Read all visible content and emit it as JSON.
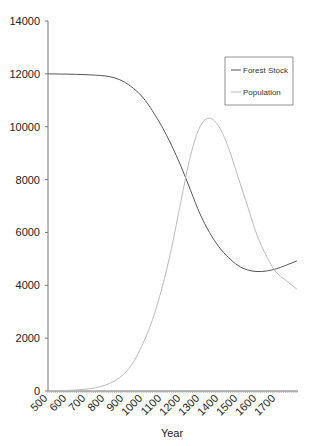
{
  "chart_data": {
    "type": "line",
    "title": "",
    "xlabel": "Year",
    "ylabel": "",
    "xlim": [
      500,
      1810
    ],
    "ylim": [
      0,
      14000
    ],
    "grid": false,
    "legend_position": "upper right",
    "x_tick_labels": [
      "500",
      "600",
      "700",
      "800",
      "900",
      "1000",
      "1100",
      "1200",
      "1300",
      "1400",
      "1500",
      "1600",
      "1700"
    ],
    "y_tick_labels": [
      "0",
      "2000",
      "4000",
      "6000",
      "8000",
      "10000",
      "12000",
      "14000"
    ],
    "x": [
      500,
      550,
      600,
      650,
      700,
      750,
      800,
      850,
      900,
      950,
      1000,
      1050,
      1100,
      1150,
      1200,
      1250,
      1300,
      1350,
      1400,
      1450,
      1500,
      1550,
      1600,
      1650,
      1700,
      1750,
      1810
    ],
    "series": [
      {
        "name": "Forest Stock",
        "color": "#555555",
        "values": [
          12000,
          11995,
          11990,
          11980,
          11970,
          11950,
          11920,
          11850,
          11700,
          11450,
          11100,
          10600,
          10000,
          9300,
          8500,
          7600,
          6700,
          6000,
          5450,
          5050,
          4750,
          4580,
          4520,
          4540,
          4620,
          4750,
          4920
        ]
      },
      {
        "name": "Population",
        "color": "#bbbbbb",
        "values": [
          0,
          10,
          20,
          40,
          70,
          120,
          220,
          380,
          650,
          1100,
          1800,
          2700,
          3900,
          5400,
          7200,
          8900,
          10000,
          10320,
          10000,
          9200,
          8100,
          7000,
          5900,
          5100,
          4500,
          4200,
          3850
        ]
      }
    ]
  }
}
